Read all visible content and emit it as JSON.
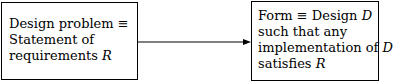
{
  "diagram": {
    "left_box": {
      "lines": [
        {
          "text": "Design problem ",
          "symbol": "≡",
          "math": ""
        },
        {
          "text": "Statement of",
          "symbol": "",
          "math": ""
        },
        {
          "text": "requirements ",
          "symbol": "",
          "math": "R"
        }
      ]
    },
    "right_box": {
      "lines": [
        {
          "text": "Form ",
          "symbol": "≡",
          "text2": " Design ",
          "math": "D"
        },
        {
          "text": "such that any",
          "symbol": "",
          "text2": "",
          "math": ""
        },
        {
          "text": "implementation of ",
          "symbol": "",
          "text2": "",
          "math": "D"
        },
        {
          "text": "satisfies ",
          "symbol": "",
          "text2": "",
          "math": "R"
        }
      ]
    },
    "edges": [
      {
        "from": "left_box",
        "to": "right_box",
        "type": "arrow"
      }
    ]
  }
}
